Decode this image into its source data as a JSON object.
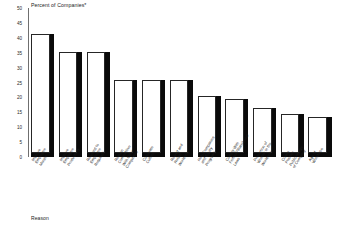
{
  "chart_data": {
    "type": "bar",
    "title": "Percent of Companies*",
    "xlabel": "Reason",
    "ylabel": "",
    "ylim": [
      0,
      50
    ],
    "yticks": [
      0,
      5,
      10,
      15,
      20,
      25,
      30,
      35,
      40,
      45,
      50
    ],
    "grid": false,
    "legend": null,
    "style": "3d-bar",
    "categories": [
      "Improve Employee Morale",
      "Improve Employee Productivity",
      "Respond to Employee Requests",
      "Remain Competitive With Other Companies",
      "Corporate Culture",
      "Recruit and Retain Workforce",
      "Help Companies and Equity Programs",
      "Comply With Federal/State/Local Laws",
      "Proportion of Women in the Workforce",
      "Create Positive Public Image of Company",
      "Age of Workforce"
    ],
    "values": [
      40,
      34,
      34,
      24.5,
      24.5,
      24.5,
      19,
      18,
      15,
      13,
      12
    ]
  },
  "footnote_marker": "*"
}
